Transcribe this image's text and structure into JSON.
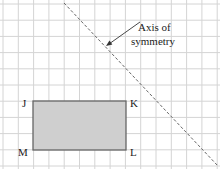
{
  "diagram": {
    "grid": {
      "color": "#d4d4d4",
      "x_start": 3,
      "x_step": 15.3,
      "cols": 15,
      "y_start": 4,
      "y_step": 16.2,
      "rows": 10
    },
    "rectangle": {
      "fill": "#cfcfcf",
      "stroke": "#666666",
      "x": 33,
      "y": 101,
      "width": 93,
      "height": 49
    },
    "vertices": [
      {
        "label": "J",
        "x": 22,
        "y": 107
      },
      {
        "label": "K",
        "x": 130,
        "y": 107
      },
      {
        "label": "L",
        "x": 130,
        "y": 156
      },
      {
        "label": "M",
        "x": 18,
        "y": 156
      }
    ],
    "axis": {
      "x1": 64,
      "y1": 3,
      "x2": 218,
      "y2": 166,
      "color": "#666666"
    },
    "annotation": {
      "line1": "Axis of",
      "line2": "symmetry",
      "arrow_from": [
        140,
        22
      ],
      "arrow_to": [
        106,
        46
      ]
    }
  }
}
